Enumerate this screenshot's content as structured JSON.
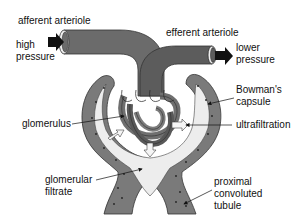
{
  "diagram": {
    "colors": {
      "vessel": "#6b6b6b",
      "vessel_dark": "#4a4a4a",
      "capsule_wall": "#7a7a7a",
      "filtrate": "#ededed",
      "background": "#ffffff",
      "arrow_flow": "#111111",
      "arrow_filtration": "#f5f5f5",
      "text": "#111111"
    },
    "labels": {
      "afferent_arteriole": "afferent arteriole",
      "high_pressure_line1": "high",
      "high_pressure_line2": "pressure",
      "efferent_arteriole": "efferent arteriole",
      "lower_pressure_line1": "lower",
      "lower_pressure_line2": "pressure",
      "bowmans_capsule_line1": "Bowman's",
      "bowmans_capsule_line2": "capsule",
      "glomerulus": "glomerulus",
      "ultrafiltration": "ultrafiltration",
      "glomerular_filtrate_line1": "glomerular",
      "glomerular_filtrate_line2": "filtrate",
      "proximal_tubule_line1": "proximal",
      "proximal_tubule_line2": "convoluted",
      "proximal_tubule_line3": "tubule"
    },
    "flow_arrows": [
      {
        "id": "inflow",
        "direction": "right",
        "meaning": "blood enters via afferent arteriole"
      },
      {
        "id": "outflow",
        "direction": "right",
        "meaning": "blood leaves via efferent arteriole"
      }
    ],
    "filtration_arrows": 3
  }
}
